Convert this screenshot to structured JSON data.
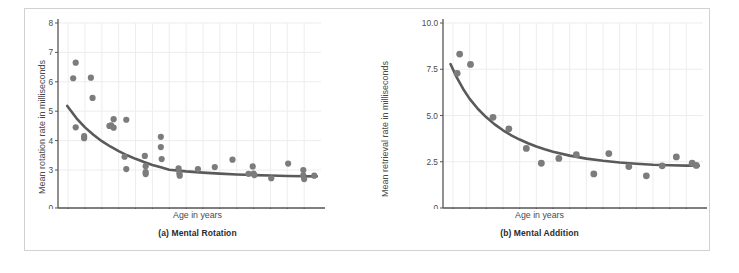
{
  "figure": {
    "panels": [
      {
        "id": "a",
        "caption": "(a) Mental Rotation",
        "xlabel": "Age in years",
        "ylabel": "Mean rotation rate in milliseconds"
      },
      {
        "id": "b",
        "caption": "(b) Mental Addition",
        "xlabel": "Age in years",
        "ylabel": "Mean retrieval rate in milliseconds"
      }
    ]
  },
  "colors": {
    "dot": "#7c7c7c",
    "curve": "#5a5a5a",
    "axis": "#555555",
    "grid": "#ededed",
    "frame": "#d2d2d2",
    "text": "#4a4a4a"
  },
  "chart_data": [
    {
      "type": "scatter",
      "title": "(a) Mental Rotation",
      "xlabel": "Age in years",
      "ylabel": "Mean rotation rate in milliseconds",
      "xlim": [
        7.4,
        23.0
      ],
      "ylim": [
        0,
        8
      ],
      "xticks": [
        8,
        9,
        10,
        11,
        12,
        13,
        14,
        15,
        16,
        17,
        18,
        19,
        20,
        21,
        22
      ],
      "yticks": [
        0,
        3,
        4,
        5,
        6,
        7,
        8
      ],
      "ytick_labels": [
        "0",
        "3",
        "4",
        "5",
        "6",
        "7",
        "8"
      ],
      "grid": true,
      "legend": "none",
      "points": [
        {
          "x": 8.45,
          "y": 6.65
        },
        {
          "x": 8.3,
          "y": 6.12
        },
        {
          "x": 9.35,
          "y": 6.14
        },
        {
          "x": 9.45,
          "y": 5.45
        },
        {
          "x": 8.45,
          "y": 4.45
        },
        {
          "x": 8.95,
          "y": 4.08
        },
        {
          "x": 8.95,
          "y": 4.15
        },
        {
          "x": 10.55,
          "y": 4.52
        },
        {
          "x": 10.45,
          "y": 4.5
        },
        {
          "x": 10.7,
          "y": 4.73
        },
        {
          "x": 10.7,
          "y": 4.44
        },
        {
          "x": 11.45,
          "y": 4.71
        },
        {
          "x": 11.35,
          "y": 3.45
        },
        {
          "x": 11.45,
          "y": 3.03
        },
        {
          "x": 12.55,
          "y": 3.48
        },
        {
          "x": 12.6,
          "y": 3.13
        },
        {
          "x": 12.6,
          "y": 2.83
        },
        {
          "x": 12.6,
          "y": 2.68
        },
        {
          "x": 13.5,
          "y": 4.13
        },
        {
          "x": 13.5,
          "y": 3.78
        },
        {
          "x": 13.55,
          "y": 3.37
        },
        {
          "x": 14.55,
          "y": 3.06
        },
        {
          "x": 14.6,
          "y": 2.74
        },
        {
          "x": 14.62,
          "y": 2.55
        },
        {
          "x": 15.7,
          "y": 3.03
        },
        {
          "x": 16.7,
          "y": 3.1
        },
        {
          "x": 17.75,
          "y": 3.35
        },
        {
          "x": 18.95,
          "y": 3.12
        },
        {
          "x": 18.7,
          "y": 2.7
        },
        {
          "x": 19.0,
          "y": 2.72
        },
        {
          "x": 19.05,
          "y": 2.6
        },
        {
          "x": 20.05,
          "y": 2.35
        },
        {
          "x": 21.05,
          "y": 3.22
        },
        {
          "x": 21.95,
          "y": 3.0
        },
        {
          "x": 21.95,
          "y": 2.58
        },
        {
          "x": 22.0,
          "y": 2.28
        },
        {
          "x": 22.6,
          "y": 2.55
        }
      ],
      "fit_curve": {
        "description": "decreasing power/exponential fit",
        "points": [
          {
            "x": 7.95,
            "y": 5.18
          },
          {
            "x": 8.5,
            "y": 4.76
          },
          {
            "x": 9.0,
            "y": 4.45
          },
          {
            "x": 9.5,
            "y": 4.2
          },
          {
            "x": 10.0,
            "y": 3.98
          },
          {
            "x": 10.5,
            "y": 3.8
          },
          {
            "x": 11.0,
            "y": 3.64
          },
          {
            "x": 11.5,
            "y": 3.5
          },
          {
            "x": 12.0,
            "y": 3.38
          },
          {
            "x": 12.5,
            "y": 3.27
          },
          {
            "x": 13.0,
            "y": 3.17
          },
          {
            "x": 13.5,
            "y": 3.09
          },
          {
            "x": 14.0,
            "y": 3.01
          },
          {
            "x": 15.0,
            "y": 2.89
          },
          {
            "x": 16.0,
            "y": 2.79
          },
          {
            "x": 17.0,
            "y": 2.71
          },
          {
            "x": 18.0,
            "y": 2.65
          },
          {
            "x": 19.0,
            "y": 2.6
          },
          {
            "x": 20.0,
            "y": 2.56
          },
          {
            "x": 21.0,
            "y": 2.53
          },
          {
            "x": 22.0,
            "y": 2.51
          },
          {
            "x": 22.75,
            "y": 2.5
          }
        ]
      }
    },
    {
      "type": "scatter",
      "title": "(b) Mental Addition",
      "xlabel": "Age in years",
      "ylabel": "Mean retrieval rate in milliseconds",
      "xlim": [
        7.4,
        23.0
      ],
      "ylim": [
        0,
        10
      ],
      "xticks": [
        8,
        9,
        10,
        11,
        12,
        13,
        14,
        15,
        16,
        17,
        18,
        19,
        20,
        21,
        22
      ],
      "yticks": [
        0,
        2.5,
        5.0,
        7.5,
        10.0
      ],
      "ytick_labels": [
        "0",
        "2.5",
        "5.0",
        "7.5",
        "10.0"
      ],
      "grid": true,
      "legend": "none",
      "points": [
        {
          "x": 8.4,
          "y": 8.32
        },
        {
          "x": 8.25,
          "y": 7.28
        },
        {
          "x": 9.05,
          "y": 7.76
        },
        {
          "x": 10.4,
          "y": 4.9
        },
        {
          "x": 11.35,
          "y": 4.28
        },
        {
          "x": 12.4,
          "y": 3.22
        },
        {
          "x": 13.3,
          "y": 2.42
        },
        {
          "x": 14.35,
          "y": 2.68
        },
        {
          "x": 15.4,
          "y": 2.88
        },
        {
          "x": 16.45,
          "y": 1.84
        },
        {
          "x": 17.35,
          "y": 2.94
        },
        {
          "x": 18.55,
          "y": 2.24
        },
        {
          "x": 19.6,
          "y": 1.74
        },
        {
          "x": 20.55,
          "y": 2.28
        },
        {
          "x": 21.4,
          "y": 2.76
        },
        {
          "x": 22.35,
          "y": 2.42
        },
        {
          "x": 22.6,
          "y": 2.3
        }
      ],
      "fit_curve": {
        "description": "decreasing power/exponential fit",
        "points": [
          {
            "x": 7.85,
            "y": 7.78
          },
          {
            "x": 8.2,
            "y": 7.1
          },
          {
            "x": 8.6,
            "y": 6.45
          },
          {
            "x": 9.0,
            "y": 5.9
          },
          {
            "x": 9.5,
            "y": 5.35
          },
          {
            "x": 10.0,
            "y": 4.9
          },
          {
            "x": 10.5,
            "y": 4.52
          },
          {
            "x": 11.0,
            "y": 4.2
          },
          {
            "x": 11.5,
            "y": 3.93
          },
          {
            "x": 12.0,
            "y": 3.7
          },
          {
            "x": 12.5,
            "y": 3.5
          },
          {
            "x": 13.0,
            "y": 3.32
          },
          {
            "x": 13.5,
            "y": 3.17
          },
          {
            "x": 14.0,
            "y": 3.04
          },
          {
            "x": 15.0,
            "y": 2.83
          },
          {
            "x": 16.0,
            "y": 2.67
          },
          {
            "x": 17.0,
            "y": 2.55
          },
          {
            "x": 18.0,
            "y": 2.46
          },
          {
            "x": 19.0,
            "y": 2.39
          },
          {
            "x": 20.0,
            "y": 2.34
          },
          {
            "x": 21.0,
            "y": 2.31
          },
          {
            "x": 22.0,
            "y": 2.29
          },
          {
            "x": 22.75,
            "y": 2.28
          }
        ]
      }
    }
  ]
}
